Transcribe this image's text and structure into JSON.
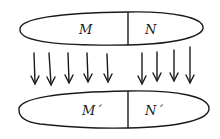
{
  "diagram": {
    "top_shape": {
      "left_label": "M",
      "right_label": "N"
    },
    "bottom_shape": {
      "left_label": "M´",
      "right_label": "N´"
    },
    "arrows": {
      "left_group_count": 5,
      "right_group_count": 4,
      "direction": "down"
    },
    "colors": {
      "stroke": "#1a1a1a",
      "background": "#ffffff"
    }
  }
}
